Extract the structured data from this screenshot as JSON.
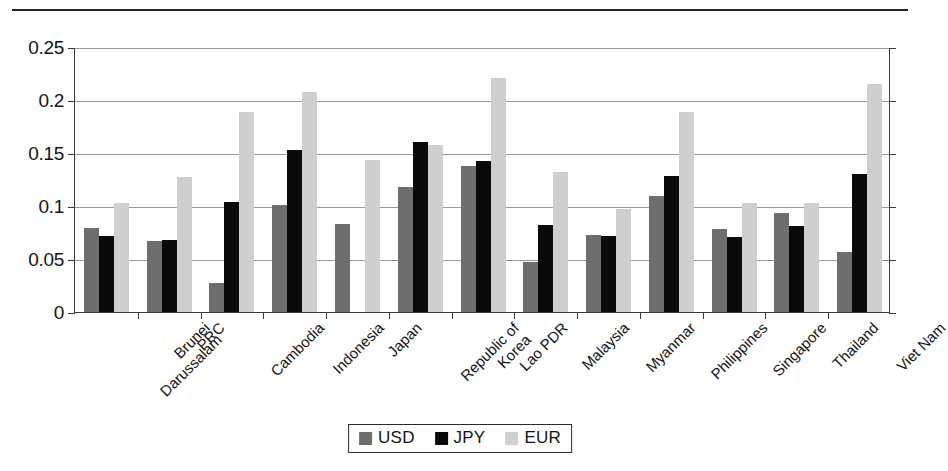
{
  "chart_data": {
    "type": "bar",
    "title": "",
    "subtitle": "",
    "xlabel": "",
    "ylabel": "",
    "ylim": [
      0,
      0.25
    ],
    "ytick_labels": [
      "0",
      "0.05",
      "0.1",
      "0.15",
      "0.2",
      "0.25"
    ],
    "ytick_values": [
      0,
      0.05,
      0.1,
      0.15,
      0.2,
      0.25
    ],
    "grid": true,
    "legend_position": "bottom-center",
    "categories": [
      "Brunei Darussalam",
      "PRC",
      "Cambodia",
      "Indonesia",
      "Japan",
      "Republic of Korea",
      "Lao PDR",
      "Malaysia",
      "Myanmar",
      "Philippines",
      "Singapore",
      "Thailand",
      "Viet Nam"
    ],
    "category_lines": [
      [
        "Brunei",
        "Darussalam"
      ],
      [
        "PRC"
      ],
      [
        "Cambodia"
      ],
      [
        "Indonesia"
      ],
      [
        "Japan"
      ],
      [
        "Republic of",
        "Korea"
      ],
      [
        "Lao PDR"
      ],
      [
        "Malaysia"
      ],
      [
        "Myanmar"
      ],
      [
        "Philippines"
      ],
      [
        "Singapore"
      ],
      [
        "Thailand"
      ],
      [
        "Viet Nam"
      ]
    ],
    "series": [
      {
        "name": "USD",
        "color": "#6e6e6e",
        "values": [
          0.079,
          0.067,
          0.027,
          0.101,
          0.083,
          0.118,
          0.138,
          0.047,
          0.073,
          0.109,
          0.078,
          0.093,
          0.057
        ]
      },
      {
        "name": "JPY",
        "color": "#0a0a0a",
        "values": [
          0.072,
          0.068,
          0.104,
          0.153,
          null,
          0.16,
          0.142,
          0.082,
          0.072,
          0.128,
          0.071,
          0.081,
          0.13
        ]
      },
      {
        "name": "EUR",
        "color": "#cfcfcf",
        "values": [
          0.103,
          0.127,
          0.189,
          0.208,
          0.143,
          0.158,
          0.221,
          0.132,
          0.097,
          0.189,
          0.103,
          0.103,
          0.215
        ]
      }
    ]
  },
  "legend": {
    "items": [
      {
        "label": "USD",
        "swatch_class": "usd"
      },
      {
        "label": "JPY",
        "swatch_class": "jpy"
      },
      {
        "label": "EUR",
        "swatch_class": "eur"
      }
    ]
  },
  "colors": {
    "usd": "#6e6e6e",
    "jpy": "#0a0a0a",
    "eur": "#cfcfcf",
    "axis": "#3a3a3a",
    "grid": "#9a9a9a",
    "text": "#141414"
  }
}
